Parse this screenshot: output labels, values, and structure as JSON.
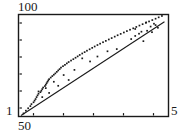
{
  "chart_data": {
    "type": "scatter",
    "title": "",
    "subtitle": "",
    "xlabel": "",
    "ylabel": "",
    "scale": "log-log",
    "grid": false,
    "legend": null,
    "frame": {
      "box": true,
      "ticks_inside": true
    },
    "xlim": [
      50,
      500
    ],
    "ylim": [
      1,
      100
    ],
    "xtick_labels": [
      "50",
      "5"
    ],
    "ytick_labels": [
      "100",
      "1"
    ],
    "xtick_count": 5,
    "ytick_count": 6,
    "point_color": "#1a1a1a",
    "line_color": "#1a1a1a",
    "frame_color": "#1a1a1a",
    "background": "#ffffff",
    "fit_line": {
      "name": "fitted trend",
      "x": [
        52,
        470
      ],
      "y": [
        1.05,
        72.0
      ]
    },
    "series": [
      {
        "name": "observations",
        "x": [
          54,
          56,
          58,
          60,
          61,
          63,
          64,
          65,
          66,
          67,
          68,
          70,
          71,
          72,
          73,
          75,
          76,
          77,
          78,
          79,
          80,
          82,
          84,
          86,
          88,
          90,
          92,
          94,
          96,
          99,
          102,
          105,
          108,
          112,
          116,
          120,
          124,
          128,
          133,
          138,
          143,
          149,
          155,
          161,
          168,
          175,
          183,
          191,
          200,
          209,
          219,
          229,
          240,
          252,
          264,
          277,
          291,
          305,
          320,
          336,
          353,
          371,
          390,
          410,
          430,
          452,
          133,
          150,
          168,
          196,
          226,
          282,
          300,
          318,
          340,
          360,
          388,
          410,
          425,
          68,
          72,
          76,
          80,
          86,
          92,
          100,
          108,
          118,
          300,
          330,
          355,
          380,
          400
        ],
        "y": [
          1.15,
          1.3,
          1.45,
          1.6,
          1.75,
          1.9,
          2.05,
          2.2,
          2.4,
          2.6,
          2.8,
          3.0,
          3.2,
          3.45,
          3.7,
          3.95,
          4.2,
          4.5,
          4.8,
          5.1,
          5.4,
          5.8,
          6.2,
          6.6,
          7.0,
          7.5,
          8.0,
          8.5,
          9.1,
          9.7,
          10.3,
          11.0,
          11.7,
          12.5,
          13.3,
          14.2,
          15.1,
          16.1,
          17.2,
          18.3,
          19.5,
          20.8,
          22.2,
          23.6,
          25.2,
          26.8,
          28.6,
          30.4,
          32.4,
          34.5,
          36.8,
          39.2,
          41.7,
          44.4,
          47.3,
          50.3,
          53.6,
          57.0,
          60.7,
          64.6,
          68.7,
          73.1,
          77.8,
          82.7,
          88.0,
          93.6,
          13.8,
          12.0,
          15.0,
          19.0,
          21.0,
          33.0,
          38.0,
          42.0,
          30.0,
          48.0,
          45.0,
          62.0,
          55.0,
          3.1,
          2.4,
          3.6,
          2.9,
          4.8,
          4.0,
          6.5,
          5.2,
          8.2,
          52.0,
          46.0,
          70.0,
          58.0,
          66.0
        ]
      }
    ]
  }
}
